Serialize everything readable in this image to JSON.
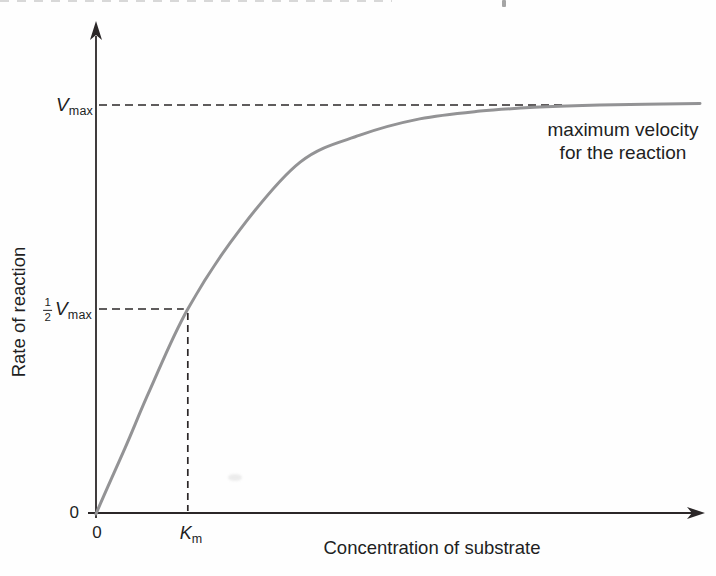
{
  "figure": {
    "y_axis_title": "Rate of reaction",
    "x_axis_title": "Concentration of substrate",
    "origin_y_label": "0",
    "origin_x_label": "0",
    "vmax": {
      "symbol": "V",
      "subscript": "max"
    },
    "half_vmax": {
      "numerator": "1",
      "denominator": "2",
      "symbol": "V",
      "subscript": "max"
    },
    "km": {
      "symbol": "K",
      "subscript": "m"
    },
    "annotation": {
      "line1": "maximum velocity",
      "line2": "for the reaction"
    }
  },
  "colors": {
    "curve": "#939395",
    "axis": "#2b2728",
    "dash": "#2b2728",
    "text": "#221e1f"
  },
  "chart_data": {
    "type": "line",
    "title": "",
    "xlabel": "Concentration of substrate",
    "ylabel": "Rate of reaction",
    "x_axis": {
      "unit": "substrate concentration (arbitrary units, fraction of axis)",
      "range": [
        0,
        1
      ],
      "ticks": [
        {
          "value": 0,
          "label": "0"
        },
        {
          "value": 0.152,
          "label": "Km"
        }
      ]
    },
    "y_axis": {
      "unit": "reaction rate (fraction of Vmax)",
      "range": [
        0,
        1.05
      ],
      "ticks": [
        {
          "value": 0,
          "label": "0"
        },
        {
          "value": 0.5,
          "label": "1/2 Vmax"
        },
        {
          "value": 1.0,
          "label": "Vmax"
        }
      ]
    },
    "km_x_fraction": 0.152,
    "vmax_y_fraction": 1.0,
    "half_vmax_y_fraction": 0.5,
    "grid": false,
    "legend": "none",
    "series": [
      {
        "name": "reaction-rate-curve",
        "points": [
          [
            0,
            0
          ],
          [
            0.048,
            0.159
          ],
          [
            0.089,
            0.301
          ],
          [
            0.152,
            0.5
          ],
          [
            0.238,
            0.694
          ],
          [
            0.338,
            0.86
          ],
          [
            0.437,
            0.926
          ],
          [
            0.536,
            0.966
          ],
          [
            0.636,
            0.985
          ],
          [
            0.735,
            0.995
          ],
          [
            0.834,
            1.0
          ],
          [
            1.0,
            1.004
          ]
        ]
      }
    ],
    "annotations": [
      {
        "text": "maximum velocity for the reaction",
        "anchor": "right of Vmax asymptote"
      },
      {
        "text": "Vmax dashed asymptote at y = Vmax"
      },
      {
        "text": "dashed guides from 1/2 Vmax to curve and down to Km"
      }
    ]
  }
}
